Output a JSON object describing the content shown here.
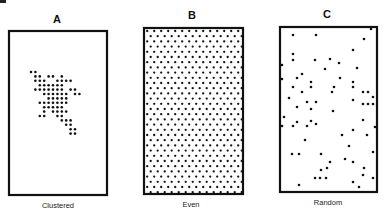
{
  "figure": {
    "width": 384,
    "height": 217,
    "ink_color": "#111111",
    "background": "#ffffff",
    "panels": [
      {
        "id": "A",
        "letter": "A",
        "caption": "Clustered",
        "pattern": "clustered",
        "frame": {
          "x": 9,
          "y": 31,
          "w": 98,
          "h": 164
        },
        "letter_pos": {
          "x": 57,
          "y": 23
        },
        "caption_pos": {
          "x": 58,
          "y": 208
        },
        "dot_radius": 1.3,
        "grid": {
          "x0": 31,
          "y0": 72,
          "step": 4.4
        },
        "cells": [
          [
            0,
            0
          ],
          [
            1,
            0
          ],
          [
            1,
            1
          ],
          [
            2,
            1
          ],
          [
            4,
            1
          ],
          [
            5,
            1
          ],
          [
            7,
            1
          ],
          [
            1,
            2
          ],
          [
            2,
            2
          ],
          [
            3,
            2
          ],
          [
            6,
            2
          ],
          [
            7,
            2
          ],
          [
            8,
            2
          ],
          [
            9,
            2
          ],
          [
            2,
            3
          ],
          [
            3,
            3
          ],
          [
            4,
            3
          ],
          [
            5,
            3
          ],
          [
            6,
            3
          ],
          [
            7,
            3
          ],
          [
            1,
            4
          ],
          [
            2,
            4
          ],
          [
            3,
            4
          ],
          [
            4,
            4
          ],
          [
            5,
            4
          ],
          [
            6,
            4
          ],
          [
            7,
            4
          ],
          [
            9,
            4
          ],
          [
            10,
            4
          ],
          [
            3,
            5
          ],
          [
            4,
            5
          ],
          [
            5,
            5
          ],
          [
            6,
            5
          ],
          [
            7,
            5
          ],
          [
            8,
            5
          ],
          [
            10,
            5
          ],
          [
            11,
            5
          ],
          [
            4,
            6
          ],
          [
            5,
            6
          ],
          [
            6,
            6
          ],
          [
            7,
            6
          ],
          [
            8,
            6
          ],
          [
            2,
            7
          ],
          [
            3,
            7
          ],
          [
            4,
            7
          ],
          [
            5,
            7
          ],
          [
            6,
            7
          ],
          [
            7,
            7
          ],
          [
            8,
            7
          ],
          [
            3,
            8
          ],
          [
            4,
            8
          ],
          [
            5,
            8
          ],
          [
            6,
            8
          ],
          [
            7,
            8
          ],
          [
            3,
            9
          ],
          [
            5,
            9
          ],
          [
            6,
            9
          ],
          [
            7,
            9
          ],
          [
            8,
            9
          ],
          [
            2,
            10
          ],
          [
            3,
            10
          ],
          [
            6,
            10
          ],
          [
            7,
            10
          ],
          [
            7,
            11
          ],
          [
            8,
            11
          ],
          [
            9,
            11
          ],
          [
            8,
            12
          ],
          [
            9,
            12
          ],
          [
            9,
            13
          ],
          [
            10,
            13
          ],
          [
            9,
            14
          ],
          [
            10,
            14
          ]
        ]
      },
      {
        "id": "B",
        "letter": "B",
        "caption": "Even",
        "pattern": "even",
        "frame": {
          "x": 144,
          "y": 28,
          "w": 99,
          "h": 166
        },
        "letter_pos": {
          "x": 192,
          "y": 19
        },
        "caption_pos": {
          "x": 191,
          "y": 207
        },
        "dot_radius": 1.15,
        "lattice": {
          "dx": 7.0,
          "dy": 5.2,
          "offset": 3.5,
          "inset_x": 3.2,
          "inset_y": 3.0
        }
      },
      {
        "id": "C",
        "letter": "C",
        "caption": "Random",
        "pattern": "random",
        "frame": {
          "x": 280,
          "y": 27,
          "w": 97,
          "h": 165
        },
        "letter_pos": {
          "x": 327,
          "y": 18
        },
        "caption_pos": {
          "x": 328,
          "y": 205
        },
        "dot_radius": 1.3,
        "points": [
          [
            293,
            35
          ],
          [
            316,
            35
          ],
          [
            371,
            29
          ],
          [
            364,
            39
          ],
          [
            293,
            54
          ],
          [
            293,
            60
          ],
          [
            353,
            50
          ],
          [
            315,
            60
          ],
          [
            330,
            59
          ],
          [
            339,
            63
          ],
          [
            282,
            65
          ],
          [
            357,
            68
          ],
          [
            325,
            69
          ],
          [
            302,
            74
          ],
          [
            282,
            79
          ],
          [
            297,
            78
          ],
          [
            340,
            78
          ],
          [
            311,
            82
          ],
          [
            353,
            82
          ],
          [
            311,
            87
          ],
          [
            353,
            87
          ],
          [
            334,
            87
          ],
          [
            293,
            87
          ],
          [
            363,
            92
          ],
          [
            368,
            92
          ],
          [
            302,
            92
          ],
          [
            373,
            97
          ],
          [
            289,
            98
          ],
          [
            307,
            102
          ],
          [
            332,
            92
          ],
          [
            353,
            100
          ],
          [
            363,
            104
          ],
          [
            368,
            104
          ],
          [
            373,
            104
          ],
          [
            297,
            107
          ],
          [
            316,
            102
          ],
          [
            333,
            111
          ],
          [
            311,
            109
          ],
          [
            284,
            117
          ],
          [
            297,
            122
          ],
          [
            311,
            121
          ],
          [
            316,
            124
          ],
          [
            293,
            126
          ],
          [
            307,
            126
          ],
          [
            363,
            120
          ],
          [
            353,
            130
          ],
          [
            367,
            135
          ],
          [
            375,
            127
          ],
          [
            305,
            140
          ],
          [
            342,
            135
          ],
          [
            349,
            146
          ],
          [
            373,
            152
          ],
          [
            292,
            154
          ],
          [
            299,
            154
          ],
          [
            321,
            154
          ],
          [
            330,
            162
          ],
          [
            345,
            159
          ],
          [
            353,
            162
          ],
          [
            321,
            170
          ],
          [
            327,
            168
          ],
          [
            364,
            168
          ],
          [
            315,
            178
          ],
          [
            320,
            178
          ],
          [
            326,
            178
          ],
          [
            373,
            178
          ],
          [
            353,
            182
          ],
          [
            299,
            185
          ],
          [
            359,
            187
          ],
          [
            363,
            175
          ],
          [
            282,
            126
          ]
        ]
      }
    ],
    "cropped_glyph": {
      "x": 0,
      "y": 0,
      "w": 6,
      "h": 3
    }
  }
}
